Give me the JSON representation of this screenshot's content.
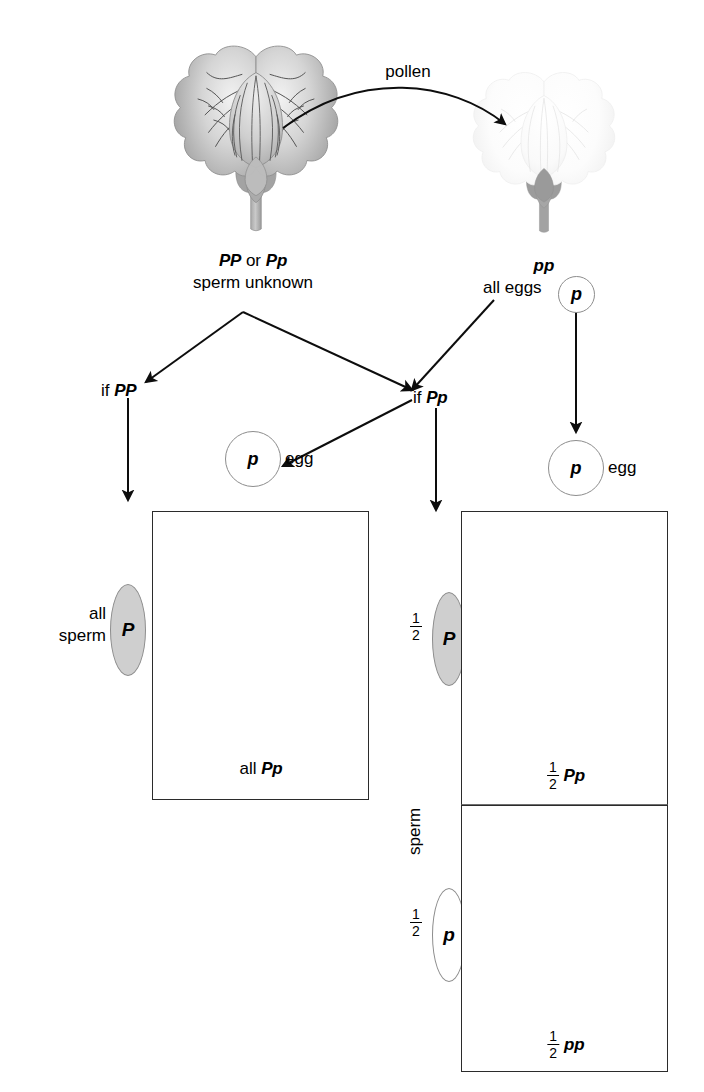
{
  "diagram": {
    "colors": {
      "purple_petal_light": "#d9d9d9",
      "purple_petal_dark": "#a8a8a8",
      "white_petal": "#fbfbfb",
      "sepal_gray": "#9b9b9b",
      "outline": "#7a7a7a",
      "box_border": "#2b2b2b",
      "gamete_fill_dominant": "#cfcfcf",
      "gamete_fill_recessive": "#ffffff",
      "text": "#000000"
    }
  },
  "top": {
    "pollen_label": "pollen",
    "parent_left": {
      "genotype_a": "PP",
      "conjunction": " or ",
      "genotype_b": "Pp",
      "note": "sperm unknown",
      "flower_type": "purple"
    },
    "parent_right": {
      "genotype": "pp",
      "note": "all eggs",
      "gamete": "p",
      "flower_type": "white"
    }
  },
  "branches": {
    "left": {
      "label_prefix": "if ",
      "genotype": "PP"
    },
    "right": {
      "label_prefix": "if ",
      "genotype": "Pp"
    }
  },
  "eggs": {
    "middle": {
      "allele": "p",
      "label": "egg"
    },
    "right": {
      "allele": "p",
      "label": "egg"
    }
  },
  "left_cross": {
    "sperm_caption_line1": "all",
    "sperm_caption_line2": "sperm",
    "sperm_allele": "P",
    "offspring": {
      "quantifier": "all",
      "genotype": "Pp",
      "flower_type": "purple"
    }
  },
  "right_cross": {
    "sperm_axis_label": "sperm",
    "rows": [
      {
        "fraction": {
          "numerator": "1",
          "denominator": "2"
        },
        "sperm_allele": "P",
        "gamete_style": "filled",
        "offspring": {
          "fraction": {
            "numerator": "1",
            "denominator": "2"
          },
          "genotype": "Pp",
          "flower_type": "purple"
        }
      },
      {
        "fraction": {
          "numerator": "1",
          "denominator": "2"
        },
        "sperm_allele": "p",
        "gamete_style": "hollow",
        "offspring": {
          "fraction": {
            "numerator": "1",
            "denominator": "2"
          },
          "genotype": "pp",
          "flower_type": "white"
        }
      }
    ]
  }
}
